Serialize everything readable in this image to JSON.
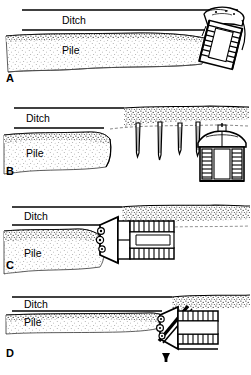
{
  "figure": {
    "background_color": "#ffffff",
    "line_color": "#000000",
    "stipple_color": "#3a3a3a",
    "width": 251,
    "height": 375
  },
  "labels": {
    "ditch": "Ditch",
    "pile": "Pile"
  },
  "panels": [
    {
      "id": "A",
      "letter": "A",
      "ditch_label": "Ditch",
      "pile_label": "Pile",
      "machine_view": "oblique-ladder-frame",
      "machine_position": "right",
      "description": "Continuous ditch with adjacent spoil pile; bucket-ladder machine at right end of cut."
    },
    {
      "id": "B",
      "letter": "B",
      "ditch_label": "Ditch",
      "pile_label": "Pile",
      "machine_view": "front-elevation",
      "machine_position": "right",
      "stake_count": 4,
      "description": "Ditch and pile terminate mid-frame; four tapered stake probes in undisturbed ground ahead of machine shown in front view."
    },
    {
      "id": "C",
      "letter": "C",
      "ditch_label": "Ditch",
      "pile_label": "Pile",
      "machine_view": "plan-top",
      "machine_position": "center",
      "description": "Plan view of machine with twin ladder tracks and cutting wheel at the working face."
    },
    {
      "id": "D",
      "letter": "D",
      "ditch_label": "Ditch",
      "pile_label": "Pile",
      "machine_view": "plan-top-angled",
      "machine_position": "right",
      "marker": "up-arrow",
      "description": "Compressed ditch and pile with machine at right; upward arrow marks the base of the working face."
    }
  ]
}
